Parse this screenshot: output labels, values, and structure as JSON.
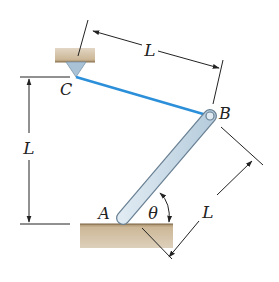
{
  "diagram": {
    "type": "mechanics-free-body-setup",
    "points": {
      "A": {
        "label": "A"
      },
      "B": {
        "label": "B"
      },
      "C": {
        "label": "C"
      }
    },
    "dimensions": {
      "top": {
        "label": "L"
      },
      "left_vertical": {
        "label": "L"
      },
      "bar_length": {
        "label": "L"
      }
    },
    "angle": {
      "label": "θ"
    },
    "colors": {
      "cable": "#2b8fd9",
      "bar_fill": "#c9dcea",
      "bar_stroke": "#6a8194",
      "ground": "#c9b394",
      "dimension_line": "#222222"
    }
  }
}
